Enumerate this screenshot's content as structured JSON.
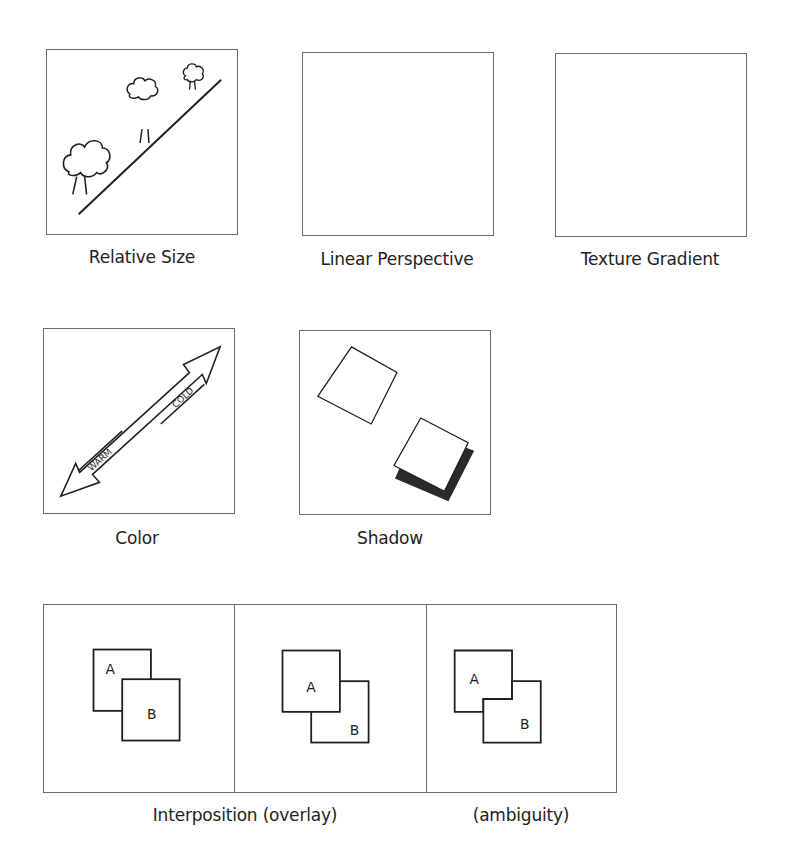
{
  "figure": {
    "panels": [
      {
        "id": "relative-size",
        "caption": "Relative Size"
      },
      {
        "id": "linear-perspective",
        "caption": "Linear Perspective"
      },
      {
        "id": "texture-gradient",
        "caption": "Texture Gradient"
      },
      {
        "id": "color",
        "caption": "Color",
        "arrow_labels": {
          "warm": "WARM",
          "cold": "COLD"
        }
      },
      {
        "id": "shadow",
        "caption": "Shadow"
      },
      {
        "id": "interposition",
        "caption": "Interposition (overlay)",
        "ambiguity_caption": "(ambiguity)",
        "subpanels": [
          {
            "front": "B",
            "labels": [
              "A",
              "B"
            ]
          },
          {
            "front": "A",
            "labels": [
              "A",
              "B"
            ]
          },
          {
            "front": "ambiguous",
            "labels": [
              "A",
              "B"
            ]
          }
        ]
      }
    ],
    "colors": {
      "line": "#1f1f1f",
      "border": "#6a6a6a",
      "shadow": "#2a2a2a",
      "background": "#ffffff"
    }
  }
}
